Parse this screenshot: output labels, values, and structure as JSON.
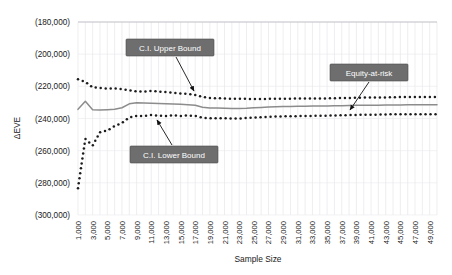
{
  "chart_data": {
    "type": "line",
    "title": "",
    "xlabel": "Sample Size",
    "ylabel": "ΔEVE",
    "grid": "vertical and horizontal light gridlines",
    "legend_position": "inline callout labels with leader arrows",
    "xlim": [
      1000,
      50000
    ],
    "ylim": [
      -300000,
      -180000
    ],
    "y_tick_labels": [
      "(180,000)",
      "(200,000)",
      "(220,000)",
      "(240,000)",
      "(260,000)",
      "(280,000)",
      "(300,000)"
    ],
    "y_tick_values": [
      -180000,
      -200000,
      -220000,
      -240000,
      -260000,
      -280000,
      -300000
    ],
    "x_tick_labels": [
      "1,000",
      "3,000",
      "5,000",
      "7,000",
      "9,000",
      "11,000",
      "13,000",
      "15,000",
      "17,000",
      "19,000",
      "21,000",
      "23,000",
      "25,000",
      "27,000",
      "29,000",
      "31,000",
      "33,000",
      "35,000",
      "37,000",
      "39,000",
      "41,000",
      "43,000",
      "45,000",
      "47,000",
      "49,000"
    ],
    "x_tick_values": [
      1000,
      3000,
      5000,
      7000,
      9000,
      11000,
      13000,
      15000,
      17000,
      19000,
      21000,
      23000,
      25000,
      27000,
      29000,
      31000,
      33000,
      35000,
      37000,
      39000,
      41000,
      43000,
      45000,
      47000,
      49000
    ],
    "x": [
      1000,
      2000,
      3000,
      4000,
      5000,
      6000,
      7000,
      8000,
      9000,
      10000,
      11000,
      12000,
      13000,
      14000,
      15000,
      16000,
      17000,
      18000,
      19000,
      20000,
      21000,
      22000,
      23000,
      24000,
      25000,
      26000,
      27000,
      28000,
      29000,
      30000,
      31000,
      32000,
      33000,
      34000,
      35000,
      36000,
      37000,
      38000,
      39000,
      40000,
      41000,
      42000,
      43000,
      44000,
      45000,
      46000,
      47000,
      48000,
      49000,
      50000
    ],
    "series": [
      {
        "name": "C.I. Upper Bound",
        "style": "dotted",
        "color": "#1c1c1c",
        "values": [
          -215600,
          -217200,
          -220600,
          -221000,
          -221400,
          -221200,
          -221700,
          -222500,
          -223100,
          -223200,
          -222900,
          -223200,
          -223600,
          -224000,
          -224400,
          -224800,
          -225400,
          -226600,
          -227200,
          -227400,
          -227500,
          -227700,
          -227700,
          -227800,
          -227900,
          -227900,
          -227800,
          -227700,
          -227700,
          -227700,
          -227600,
          -227500,
          -227600,
          -227500,
          -227500,
          -227400,
          -227300,
          -227200,
          -227100,
          -227000,
          -227000,
          -226900,
          -226900,
          -226800,
          -226700,
          -226700,
          -226600,
          -226600,
          -226600,
          -226600
        ]
      },
      {
        "name": "Equity-at-risk",
        "style": "solid",
        "color": "#8c8c8c",
        "values": [
          -234300,
          -229300,
          -234600,
          -234700,
          -234500,
          -234200,
          -233300,
          -230900,
          -230200,
          -230300,
          -230500,
          -230700,
          -230800,
          -231000,
          -231200,
          -231400,
          -231800,
          -233000,
          -233400,
          -233500,
          -233600,
          -233800,
          -233800,
          -233600,
          -233300,
          -233100,
          -232900,
          -232700,
          -232600,
          -232500,
          -232400,
          -232400,
          -232300,
          -232200,
          -232200,
          -232100,
          -232000,
          -231900,
          -231800,
          -231800,
          -231700,
          -231700,
          -231600,
          -231600,
          -231600,
          -231500,
          -231500,
          -231500,
          -231500,
          -231500
        ]
      },
      {
        "name": "C.I. Lower Bound",
        "style": "dotted",
        "color": "#1c1c1c",
        "values": [
          -283300,
          -252700,
          -256800,
          -248500,
          -247500,
          -244700,
          -242800,
          -239400,
          -238400,
          -238400,
          -237800,
          -238200,
          -238500,
          -237900,
          -238400,
          -238100,
          -238400,
          -239500,
          -239800,
          -239900,
          -239900,
          -240000,
          -240000,
          -239700,
          -239400,
          -239200,
          -239000,
          -238800,
          -238700,
          -238600,
          -238500,
          -238500,
          -238400,
          -238300,
          -238200,
          -238100,
          -238000,
          -237900,
          -237800,
          -237700,
          -237600,
          -237600,
          -237500,
          -237400,
          -237400,
          -237300,
          -237300,
          -237300,
          -237300,
          -237300
        ]
      }
    ],
    "annotations": [
      {
        "label": "C.I. Upper Bound",
        "target_x": 10000,
        "target_series": "C.I. Upper Bound"
      },
      {
        "label": "Equity-at-risk",
        "target_x": 37500,
        "target_series": "Equity-at-risk"
      },
      {
        "label": "C.I. Lower Bound",
        "target_x": 11500,
        "target_series": "C.I. Lower Bound"
      }
    ]
  },
  "axes": {
    "y_label": "ΔEVE",
    "x_label": "Sample Size"
  },
  "callouts": {
    "upper": "C.I. Upper Bound",
    "eve": "Equity-at-risk",
    "lower": "C.I. Lower Bound"
  }
}
